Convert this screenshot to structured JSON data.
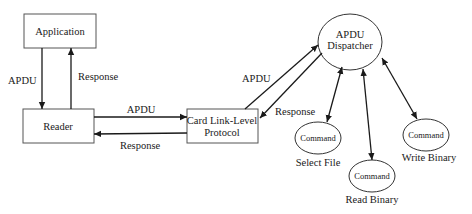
{
  "nodes": {
    "application": "Application",
    "reader": "Reader",
    "card_link_line1": "Card Link-Level",
    "card_link_line2": "Protocol",
    "dispatcher_line1": "APDU",
    "dispatcher_line2": "Dispatcher",
    "commands": [
      {
        "label": "Command",
        "caption": "Select File"
      },
      {
        "label": "Command",
        "caption": "Read Binary"
      },
      {
        "label": "Command",
        "caption": "Write Binary"
      }
    ]
  },
  "edges": {
    "app_to_reader": "APDU",
    "reader_to_app": "Response",
    "reader_to_card": "APDU",
    "card_to_reader": "Response",
    "card_to_dispatcher": "APDU",
    "dispatcher_to_card": "Response"
  },
  "colors": {
    "line": "#1a1a1a",
    "border": "#555555",
    "background": "#ffffff"
  }
}
